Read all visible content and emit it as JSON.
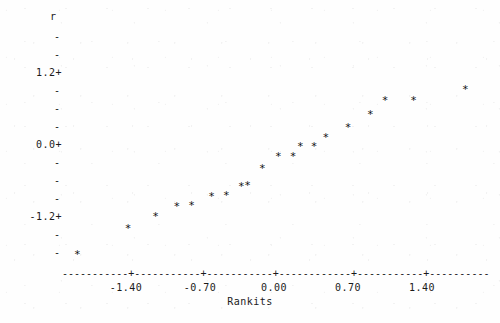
{
  "plot": {
    "style": "character-plot",
    "marker_glyph": "*",
    "axis_line_glyph": "-",
    "axis_tick_glyph": "+",
    "y_tick_glyph": "-",
    "ink_color": "#1a1a1a",
    "background_color": "#fefefe"
  },
  "chart_data": {
    "type": "scatter",
    "title": "",
    "subtitle": "",
    "xlabel": "Rankits",
    "ylabel": "r",
    "grid": false,
    "legend": null,
    "xlim": [
      -1.94,
      1.99
    ],
    "ylim": [
      -1.82,
      1.8
    ],
    "xticks": [
      -1.4,
      -0.7,
      0.0,
      0.7,
      1.4
    ],
    "xtick_labels": [
      "-1.40",
      "-0.70",
      "0.00",
      "0.70",
      "1.40"
    ],
    "yticks": [
      1.2,
      0.0,
      -1.2
    ],
    "ytick_labels": [
      "1.2+",
      "0.0+",
      "-1.2+"
    ],
    "y_minor_tick_count_top": 3,
    "y_minor_tick_count_mid": 4,
    "y_minor_tick_count_bottom": 3,
    "n_points": 20,
    "x": [
      -1.86,
      -1.38,
      -1.12,
      -0.92,
      -0.78,
      -0.59,
      -0.45,
      -0.31,
      -0.25,
      -0.11,
      0.04,
      0.18,
      0.25,
      0.38,
      0.49,
      0.7,
      0.91,
      1.05,
      1.32,
      1.81
    ],
    "y": [
      -1.85,
      -1.42,
      -1.22,
      -1.05,
      -1.03,
      -0.88,
      -0.87,
      -0.72,
      -0.7,
      -0.42,
      -0.22,
      -0.22,
      -0.05,
      -0.05,
      0.1,
      0.27,
      0.48,
      0.72,
      0.72,
      0.9
    ],
    "points": [
      {
        "x": -1.86,
        "y": -1.85
      },
      {
        "x": -1.38,
        "y": -1.42
      },
      {
        "x": -1.12,
        "y": -1.22
      },
      {
        "x": -0.92,
        "y": -1.05
      },
      {
        "x": -0.78,
        "y": -1.03
      },
      {
        "x": -0.59,
        "y": -0.88
      },
      {
        "x": -0.45,
        "y": -0.87
      },
      {
        "x": -0.31,
        "y": -0.72
      },
      {
        "x": -0.25,
        "y": -0.7
      },
      {
        "x": -0.11,
        "y": -0.42
      },
      {
        "x": 0.04,
        "y": -0.22
      },
      {
        "x": 0.18,
        "y": -0.22
      },
      {
        "x": 0.25,
        "y": -0.05
      },
      {
        "x": 0.38,
        "y": -0.05
      },
      {
        "x": 0.49,
        "y": 0.1
      },
      {
        "x": 0.7,
        "y": 0.27
      },
      {
        "x": 0.91,
        "y": 0.48
      },
      {
        "x": 1.05,
        "y": 0.72
      },
      {
        "x": 1.32,
        "y": 0.72
      },
      {
        "x": 1.81,
        "y": 0.9
      }
    ]
  }
}
